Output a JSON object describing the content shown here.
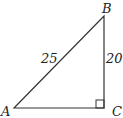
{
  "diagram": {
    "type": "right-triangle",
    "vertices": {
      "A": {
        "label": "A"
      },
      "B": {
        "label": "B"
      },
      "C": {
        "label": "C"
      }
    },
    "sides": {
      "AB": {
        "label": "25"
      },
      "BC": {
        "label": "20"
      }
    },
    "right_angle_at": "C",
    "line_color": "#333333"
  }
}
